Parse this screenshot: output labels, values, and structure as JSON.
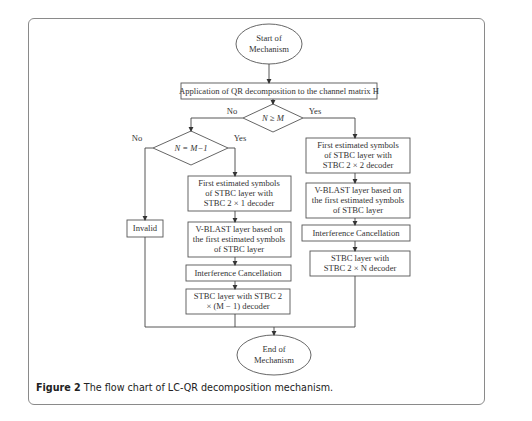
{
  "figure": {
    "caption_label": "Figure 2",
    "caption_text": " The flow chart of LC-QR decomposition mechanism."
  },
  "nodes": {
    "start": [
      "Start of",
      "Mechanism"
    ],
    "qr": "Application of QR decomposition to the channel matrix H",
    "cond1": "N ≥ M",
    "cond2": "N = M−1",
    "invalid": "Invalid",
    "mid1": [
      "First estimated symbols",
      "of STBC layer with",
      "STBC 2 × 1 decoder"
    ],
    "mid2": [
      "V-BLAST layer based on",
      "the first estimated symbols",
      "of STBC layer"
    ],
    "mid3": "Interference Cancellation",
    "mid4": [
      "STBC layer with STBC 2",
      "× (M − 1) decoder"
    ],
    "right1": [
      "First estimated symbols",
      "of STBC layer with",
      "STBC 2 × 2 decoder"
    ],
    "right2": [
      "V-BLAST layer based on",
      "the first estimated symbols",
      "of STBC layer"
    ],
    "right3": "Interference Cancellation",
    "right4": [
      "STBC layer with",
      "STBC 2 × N decoder"
    ],
    "end": [
      "End of",
      "Mechanism"
    ]
  },
  "edge_labels": {
    "cond1_no": "No",
    "cond1_yes": "Yes",
    "cond2_no": "No",
    "cond2_yes": "Yes"
  }
}
